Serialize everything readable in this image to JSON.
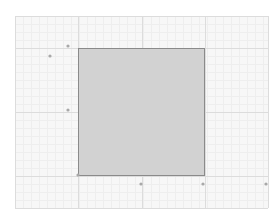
{
  "canvas": {
    "background": "#ffffff",
    "grid": {
      "minor_color": "#eeeeee",
      "major_color": "#dcdcdc",
      "background": "#f7f7f7"
    }
  },
  "shapes": [
    {
      "type": "rectangle",
      "name": "selected-rectangle",
      "fill": "#d2d2d2",
      "stroke": "#8a8a8a"
    }
  ],
  "markers": [
    {
      "name": "marker-top-left-outer"
    },
    {
      "name": "marker-left-upper"
    },
    {
      "name": "marker-left-middle"
    },
    {
      "name": "marker-rect-bottom-left"
    },
    {
      "name": "marker-bottom-middle"
    },
    {
      "name": "marker-bottom-right"
    },
    {
      "name": "marker-far-right"
    }
  ],
  "colors": {
    "marker": "#a8a8a8"
  }
}
